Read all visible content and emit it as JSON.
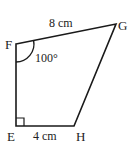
{
  "diagram": {
    "type": "quadrilateral",
    "vertices": {
      "E": {
        "label": "E"
      },
      "F": {
        "label": "F"
      },
      "G": {
        "label": "G"
      },
      "H": {
        "label": "H"
      }
    },
    "sides": {
      "FG": {
        "label": "8 cm"
      },
      "EH": {
        "label": "4 cm"
      }
    },
    "angles": {
      "F": {
        "label": "100°"
      },
      "E": {
        "label": "right-angle"
      }
    },
    "colors": {
      "stroke": "#1a1a1a",
      "text": "#222222",
      "background": "#ffffff"
    }
  }
}
